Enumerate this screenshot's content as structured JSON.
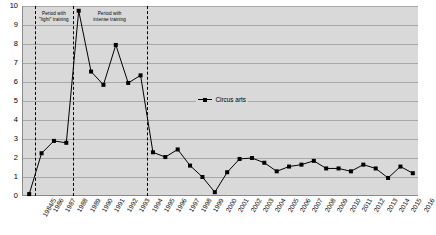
{
  "chart_data": {
    "type": "line",
    "title": "",
    "xlabel": "",
    "ylabel": "",
    "ylim": [
      0,
      10
    ],
    "ytick_labels": [
      "0",
      "1",
      "2",
      "3",
      "4",
      "5",
      "6",
      "7",
      "8",
      "9",
      "10"
    ],
    "grid": true,
    "legend_position": "center-right",
    "legend": [
      "Circus arts"
    ],
    "categories": [
      "1984/5",
      "1986",
      "1987",
      "1988",
      "1989",
      "1990",
      "1991",
      "1992",
      "1993",
      "1994",
      "1995",
      "1996",
      "1997",
      "1998",
      "1999",
      "2000",
      "2001",
      "2002",
      "2003",
      "2004",
      "2005",
      "2006",
      "2007",
      "2008",
      "2009",
      "2010",
      "2011",
      "2012",
      "2013",
      "2014",
      "2015",
      "2016"
    ],
    "series": [
      {
        "name": "Circus arts",
        "values": [
          0.1,
          2.25,
          2.9,
          2.8,
          9.75,
          6.55,
          5.85,
          7.95,
          5.95,
          6.35,
          2.3,
          2.05,
          2.45,
          1.6,
          1.0,
          0.2,
          1.25,
          1.95,
          2.0,
          1.75,
          1.3,
          1.55,
          1.65,
          1.85,
          1.45,
          1.45,
          1.3,
          1.65,
          1.45,
          0.95,
          1.55,
          1.2
        ]
      }
    ],
    "annotations": [
      {
        "text": "Period with\n\"light\" training"
      },
      {
        "text": "Period with\nintense training"
      }
    ],
    "dividers": [
      "1986",
      "1989",
      "1995"
    ]
  }
}
